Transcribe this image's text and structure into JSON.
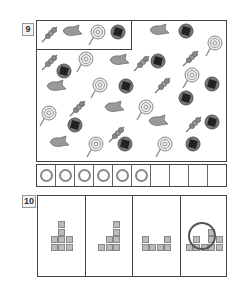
{
  "q9": {
    "label": "9",
    "legend": [
      "dango",
      "fish-cake",
      "lollipop",
      "rice-cracker"
    ],
    "items": [
      {
        "t": "fish-cake",
        "x": 158,
        "y": 33
      },
      {
        "t": "rice-cracker",
        "x": 188,
        "y": 33
      },
      {
        "t": "lollipop",
        "x": 213,
        "y": 45
      },
      {
        "t": "dango",
        "x": 50,
        "y": 62
      },
      {
        "t": "lollipop",
        "x": 84,
        "y": 61
      },
      {
        "t": "fish-cake",
        "x": 118,
        "y": 63
      },
      {
        "t": "dango",
        "x": 142,
        "y": 63
      },
      {
        "t": "rice-cracker",
        "x": 160,
        "y": 63
      },
      {
        "t": "dango",
        "x": 191,
        "y": 58
      },
      {
        "t": "rice-cracker",
        "x": 66,
        "y": 73
      },
      {
        "t": "lollipop",
        "x": 98,
        "y": 87
      },
      {
        "t": "dango",
        "x": 163,
        "y": 85
      },
      {
        "t": "lollipop",
        "x": 190,
        "y": 77
      },
      {
        "t": "rice-cracker",
        "x": 214,
        "y": 86
      },
      {
        "t": "fish-cake",
        "x": 55,
        "y": 89
      },
      {
        "t": "rice-cracker",
        "x": 128,
        "y": 88
      },
      {
        "t": "lollipop",
        "x": 47,
        "y": 115
      },
      {
        "t": "dango",
        "x": 78,
        "y": 108
      },
      {
        "t": "fish-cake",
        "x": 113,
        "y": 110
      },
      {
        "t": "lollipop",
        "x": 144,
        "y": 109
      },
      {
        "t": "rice-cracker",
        "x": 188,
        "y": 100
      },
      {
        "t": "dango",
        "x": 194,
        "y": 124
      },
      {
        "t": "fish-cake",
        "x": 157,
        "y": 124
      },
      {
        "t": "rice-cracker",
        "x": 77,
        "y": 127
      },
      {
        "t": "dango",
        "x": 117,
        "y": 134
      },
      {
        "t": "rice-cracker",
        "x": 214,
        "y": 124
      },
      {
        "t": "fish-cake",
        "x": 58,
        "y": 145
      },
      {
        "t": "lollipop",
        "x": 94,
        "y": 146
      },
      {
        "t": "rice-cracker",
        "x": 127,
        "y": 146
      },
      {
        "t": "lollipop",
        "x": 163,
        "y": 146
      },
      {
        "t": "rice-cracker",
        "x": 195,
        "y": 146
      }
    ],
    "answer_cells_total": 10,
    "answer_cells_marked": 6
  },
  "q10": {
    "label": "10",
    "figures": [
      {
        "blocks": [
          [
            1,
            0
          ],
          [
            1,
            1
          ],
          [
            0,
            2
          ],
          [
            1,
            2
          ],
          [
            2,
            2
          ],
          [
            0,
            3
          ],
          [
            1,
            3
          ],
          [
            2,
            3
          ]
        ]
      },
      {
        "blocks": [
          [
            2,
            0
          ],
          [
            2,
            1
          ],
          [
            1,
            2
          ],
          [
            2,
            2
          ],
          [
            0,
            3
          ],
          [
            1,
            3
          ],
          [
            2,
            3
          ]
        ]
      },
      {
        "blocks": [
          [
            0,
            2
          ],
          [
            3,
            2
          ],
          [
            0,
            3
          ],
          [
            1,
            3
          ],
          [
            2,
            3
          ],
          [
            3,
            3
          ]
        ]
      },
      {
        "blocks": [
          [
            3,
            1
          ],
          [
            1,
            2
          ],
          [
            3,
            2
          ],
          [
            4,
            2
          ],
          [
            0,
            3
          ],
          [
            1,
            3
          ],
          [
            2,
            3
          ],
          [
            3,
            3
          ],
          [
            4,
            3
          ]
        ],
        "circled": true
      }
    ]
  }
}
